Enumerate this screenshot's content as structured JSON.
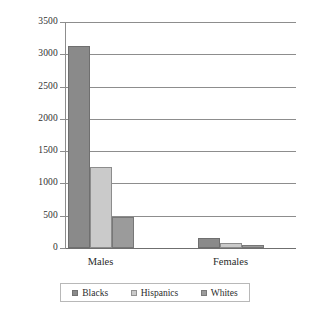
{
  "chart_data": {
    "type": "bar",
    "title": "",
    "subtitle": "",
    "xlabel": "",
    "ylabel": "",
    "categories": [
      "Males",
      "Females"
    ],
    "series": [
      {
        "name": "Blacks",
        "values": [
          3130,
          150
        ],
        "color": "#8a8a8a"
      },
      {
        "name": "Hispanics",
        "values": [
          1250,
          70
        ],
        "color": "#cacaca"
      },
      {
        "name": "Whites",
        "values": [
          480,
          50
        ],
        "color": "#9b9b9b"
      }
    ],
    "ylim": [
      0,
      3500
    ],
    "ytick_step": 500,
    "yticks": [
      "3500",
      "3000",
      "2500",
      "2000",
      "1500",
      "1000",
      "500",
      "0"
    ],
    "grid": true,
    "legend_position": "bottom"
  },
  "axis": {
    "y_labels": [
      "3500",
      "3000",
      "2500",
      "2000",
      "1500",
      "1000",
      "500",
      "0"
    ],
    "x_labels": [
      "Males",
      "Females"
    ]
  },
  "legend": {
    "items": [
      {
        "label": "Blacks",
        "color": "#8a8a8a"
      },
      {
        "label": "Hispanics",
        "color": "#cacaca"
      },
      {
        "label": "Whites",
        "color": "#9b9b9b"
      }
    ]
  }
}
